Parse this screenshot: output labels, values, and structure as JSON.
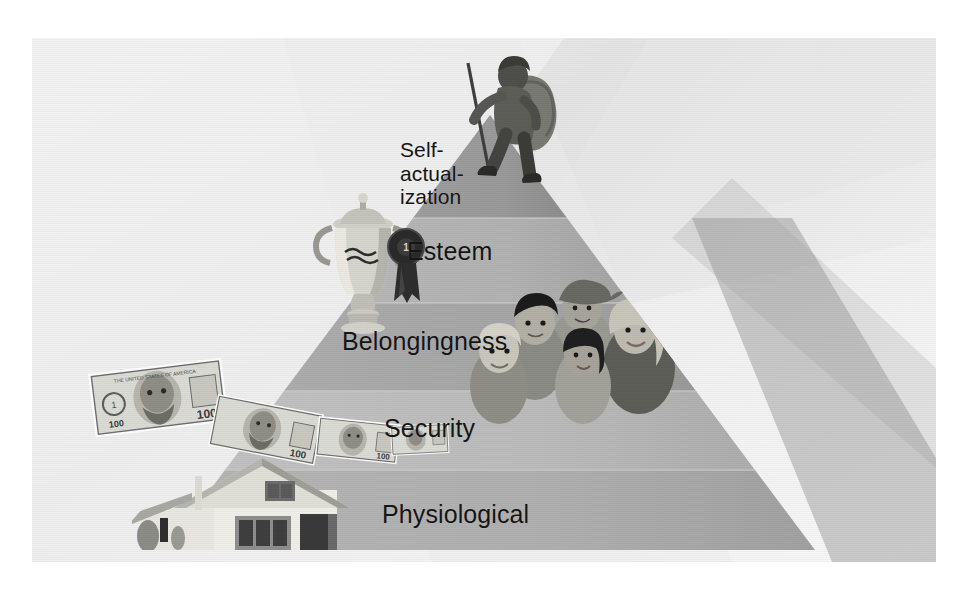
{
  "figure": {
    "kind": "maslow-hierarchy-of-needs-pyramid",
    "orientation": "apex-top",
    "tier_count": 5
  },
  "tiers": [
    {
      "id": "self-actualization",
      "label": "Self-\nactual-\nization",
      "label_plain": "Self-actualization",
      "level": 5,
      "position": "apex",
      "fill": "#9a9a9a",
      "illustration": "mountain-climber-hiker-with-backpack-icon"
    },
    {
      "id": "esteem",
      "label": "Esteem",
      "label_plain": "Esteem",
      "level": 4,
      "fill": "#b3b3b3",
      "illustration": "trophy-and-award-ribbon-icon"
    },
    {
      "id": "belongingness",
      "label": "Belongingness",
      "label_plain": "Belongingness",
      "level": 3,
      "fill": "#a8a8a8",
      "illustration": "group-of-five-people-icon"
    },
    {
      "id": "security",
      "label": "Security",
      "label_plain": "Security",
      "level": 2,
      "fill": "#bdbdbd",
      "illustration": "cascade-of-hundred-dollar-bills-icon"
    },
    {
      "id": "physiological",
      "label": "Physiological",
      "label_plain": "Physiological",
      "level": 1,
      "position": "base",
      "fill": "#b0b0b0",
      "illustration": "house-icon"
    }
  ],
  "illustrations": {
    "climber": {
      "name": "mountain-climber-hiker-with-backpack-icon",
      "tier": "self-actualization"
    },
    "trophy": {
      "name": "trophy-cup-icon",
      "tier": "esteem"
    },
    "ribbon": {
      "name": "award-ribbon-rosette-icon",
      "tier": "esteem"
    },
    "people": {
      "name": "group-of-five-people-icon",
      "tier": "belongingness",
      "count": 5
    },
    "money": {
      "name": "hundred-dollar-bills-icon",
      "tier": "security",
      "bill_denomination": "100",
      "bill_count": 4
    },
    "house": {
      "name": "single-family-house-icon",
      "tier": "physiological"
    }
  },
  "palette": {
    "background": "#f2f2f2",
    "page": "#ffffff",
    "text": "#151515",
    "pyramid_light": "#bdbdbd",
    "pyramid_mid": "#ababab",
    "pyramid_dark": "#8f8f8f",
    "shadow_band": "#8c8c8c",
    "ray_light": "#ebebeb"
  }
}
